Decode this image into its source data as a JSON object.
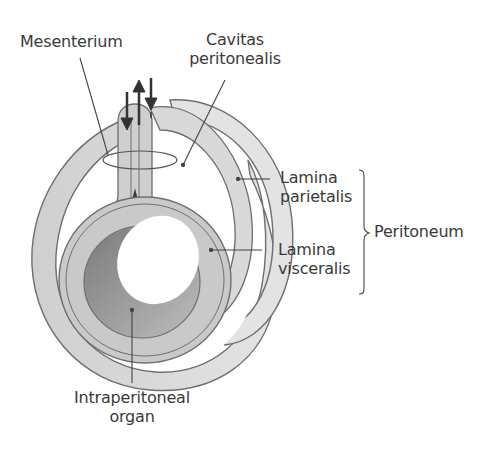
{
  "diagram": {
    "type": "anatomical cross-section",
    "labels": {
      "mesenterium": "Mesenterium",
      "cavitas_line1": "Cavitas",
      "cavitas_line2": "peritonealis",
      "parietalis_line1": "Lamina",
      "parietalis_line2": "parietalis",
      "visceralis_line1": "Lamina",
      "visceralis_line2": "visceralis",
      "peritoneum": "Peritoneum",
      "organ_line1": "Intraperitoneal",
      "organ_line2": "organ"
    },
    "colors": {
      "outline": "#6e6e6e",
      "outer_wall": "#d8d8d8",
      "organ_wall": "#c9c9c9",
      "lumen_shadow": "#9a9a9a",
      "label_text": "#3a3a3a",
      "dark_wedge": "#3d3d3d"
    }
  }
}
